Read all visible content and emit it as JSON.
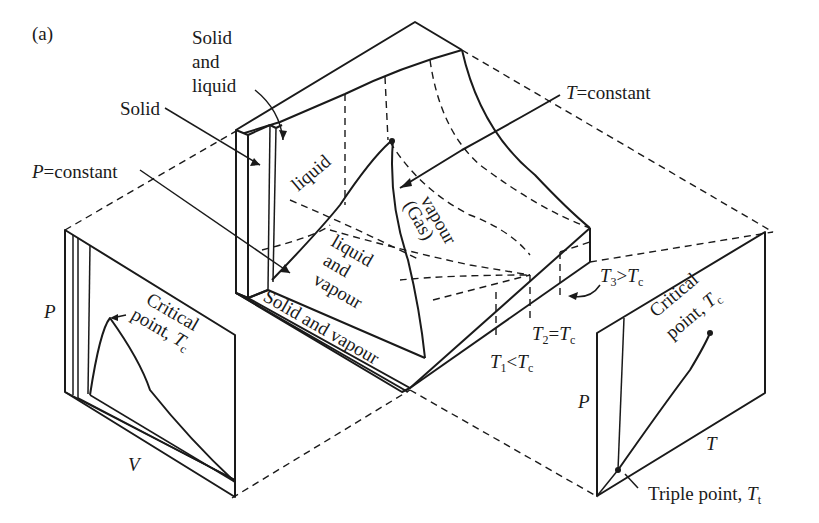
{
  "figure": {
    "panel_label": "(a)",
    "ink_color": "#1a1a1a",
    "background": "#ffffff"
  },
  "surface_labels": {
    "solid": "Solid",
    "solid_and_liquid_1": "Solid",
    "solid_and_liquid_2": "and",
    "solid_and_liquid_3": "liquid",
    "liquid": "liquid",
    "liquid_and_vapour_1": "liquid",
    "liquid_and_vapour_2": "and",
    "liquid_and_vapour_3": "vapour",
    "vapour_1": "vapour",
    "vapour_2": "(Gas)",
    "solid_and_vapour": "Solid and vapour"
  },
  "annotations": {
    "p_constant_var": "P",
    "p_constant_text": "=constant",
    "t_constant_var": "T",
    "t_constant_text": "=constant",
    "t1_var": "T",
    "t1_sub": "1",
    "t1_rel": "<",
    "t1_ref": "T",
    "t1_ref_sub": "c",
    "t2_var": "T",
    "t2_sub": "2",
    "t2_rel": "=",
    "t2_ref": "T",
    "t2_ref_sub": "c",
    "t3_var": "T",
    "t3_sub": "3",
    "t3_rel": ">",
    "t3_ref": "T",
    "t3_ref_sub": "c"
  },
  "pv_projection": {
    "y_axis": "P",
    "x_axis": "V",
    "critical_1": "Critical",
    "critical_2": "point, ",
    "critical_var": "T",
    "critical_sub": "c"
  },
  "pt_projection": {
    "y_axis": "P",
    "x_axis": "T",
    "critical_1": "Critical",
    "critical_2": "point, ",
    "critical_var": "T",
    "critical_sub": "c",
    "triple_text": "Triple point, ",
    "triple_var": "T",
    "triple_sub": "t"
  }
}
